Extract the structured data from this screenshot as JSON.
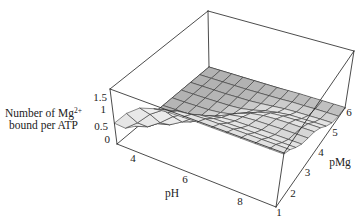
{
  "chart_data": {
    "type": "surface",
    "title": "",
    "xlabel": "pH",
    "ylabel": "pMg",
    "zlabel": "Number of Mg2+ bound per ATP",
    "zlabel_parts": {
      "line1": "Number of Mg",
      "sup": "2+",
      "line2": "bound per ATP"
    },
    "x_ticks": [
      "4",
      "6",
      "8"
    ],
    "y_ticks": [
      "1",
      "2",
      "3",
      "4",
      "5",
      "6"
    ],
    "z_ticks": [
      "0",
      "0.5",
      "1",
      "1.5"
    ],
    "xlim": [
      3,
      9
    ],
    "ylim": [
      1,
      6
    ],
    "zlim": [
      0,
      1.9
    ],
    "grid": false,
    "box": true,
    "legend": null,
    "x": [
      3.0,
      3.5,
      4.0,
      4.5,
      5.0,
      5.5,
      6.0,
      6.5,
      7.0,
      7.5,
      8.0,
      8.5,
      9.0
    ],
    "y": [
      1.0,
      1.5,
      2.0,
      2.5,
      3.0,
      3.5,
      4.0,
      4.5,
      5.0,
      5.5,
      6.0
    ],
    "z": [
      [
        0.72,
        0.28,
        0.08,
        0.02,
        0.01,
        0.0,
        0.0,
        0.0,
        0.0,
        0.0,
        0.0
      ],
      [
        1.24,
        0.64,
        0.23,
        0.07,
        0.02,
        0.01,
        0.0,
        0.0,
        0.0,
        0.0,
        0.0
      ],
      [
        1.61,
        1.11,
        0.54,
        0.19,
        0.06,
        0.02,
        0.01,
        0.0,
        0.0,
        0.0,
        0.0
      ],
      [
        1.77,
        1.44,
        0.92,
        0.45,
        0.17,
        0.06,
        0.02,
        0.01,
        0.0,
        0.0,
        0.0
      ],
      [
        1.83,
        1.58,
        1.19,
        0.77,
        0.4,
        0.17,
        0.06,
        0.02,
        0.01,
        0.0,
        0.0
      ],
      [
        1.85,
        1.64,
        1.31,
        0.99,
        0.68,
        0.37,
        0.15,
        0.05,
        0.02,
        0.01,
        0.0
      ],
      [
        1.86,
        1.66,
        1.36,
        1.09,
        0.88,
        0.62,
        0.33,
        0.13,
        0.05,
        0.02,
        0.0
      ],
      [
        1.86,
        1.66,
        1.37,
        1.13,
        0.96,
        0.77,
        0.5,
        0.24,
        0.09,
        0.03,
        0.01
      ],
      [
        1.86,
        1.66,
        1.38,
        1.14,
        0.99,
        0.84,
        0.61,
        0.32,
        0.13,
        0.05,
        0.02
      ],
      [
        1.86,
        1.66,
        1.38,
        1.15,
        1.0,
        0.87,
        0.65,
        0.37,
        0.15,
        0.05,
        0.02
      ],
      [
        1.86,
        1.66,
        1.38,
        1.15,
        1.01,
        0.88,
        0.66,
        0.38,
        0.16,
        0.06,
        0.02
      ],
      [
        1.86,
        1.66,
        1.38,
        1.15,
        1.01,
        0.88,
        0.67,
        0.39,
        0.17,
        0.06,
        0.02
      ],
      [
        1.86,
        1.66,
        1.38,
        1.15,
        1.01,
        0.88,
        0.67,
        0.39,
        0.17,
        0.06,
        0.02
      ]
    ]
  },
  "colors": {
    "background": "#ffffff",
    "box_line": "#1e1e1e",
    "mesh_line": "#2e2e2e",
    "text": "#222222"
  }
}
